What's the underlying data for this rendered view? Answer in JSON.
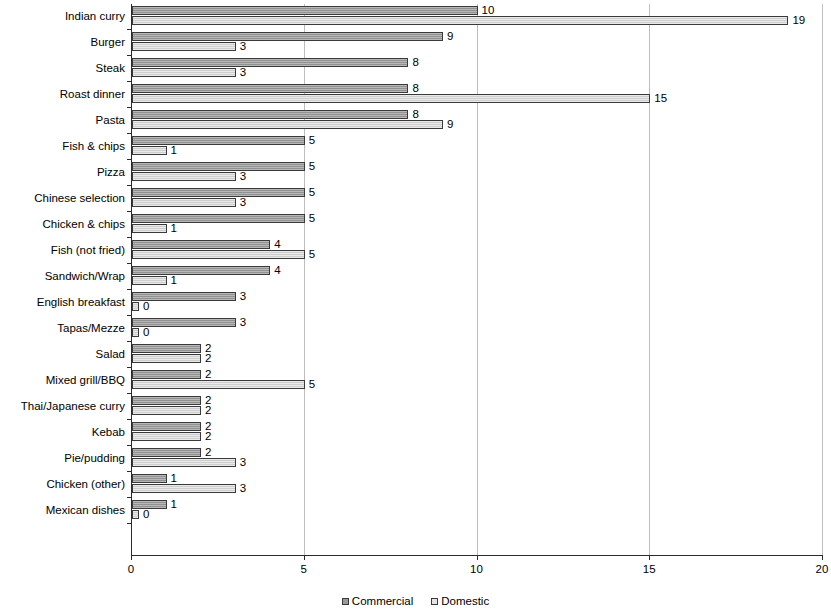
{
  "chart_data": {
    "type": "bar",
    "orientation": "horizontal",
    "title": "",
    "subtitle": "",
    "xlabel": "",
    "ylabel": "",
    "xlim": [
      0,
      20
    ],
    "xticks": [
      0,
      5,
      10,
      15,
      20
    ],
    "xtick_labels": [
      "0",
      "5",
      "10",
      "15",
      "20"
    ],
    "grid": true,
    "grid_axis": "x",
    "legend_position": "bottom",
    "categories": [
      "Indian curry",
      "Burger",
      "Steak",
      "Roast dinner",
      "Pasta",
      "Fish & chips",
      "Pizza",
      "Chinese selection",
      "Chicken & chips",
      "Fish (not fried)",
      "Sandwich/Wrap",
      "English breakfast",
      "Tapas/Mezze",
      "Salad",
      "Mixed grill/BBQ",
      "Thai/Japanese curry",
      "Kebab",
      "Pie/pudding",
      "Chicken (other)",
      "Mexican dishes"
    ],
    "series": [
      {
        "name": "Commercial",
        "color": "#9a9a9a",
        "values": [
          10,
          9,
          8,
          8,
          8,
          5,
          5,
          5,
          5,
          4,
          4,
          3,
          3,
          2,
          2,
          2,
          2,
          2,
          1,
          1
        ],
        "labels": [
          "10",
          "9",
          "8",
          "8",
          "8",
          "5",
          "5",
          "5",
          "5",
          "4",
          "4",
          "3",
          "3",
          "2",
          "2",
          "2",
          "2",
          "2",
          "1",
          "1"
        ]
      },
      {
        "name": "Domestic",
        "color": "#d9d9d9",
        "values": [
          19,
          3,
          3,
          15,
          9,
          1,
          3,
          3,
          1,
          5,
          1,
          0,
          0,
          2,
          5,
          2,
          2,
          3,
          3,
          0
        ],
        "labels": [
          "19",
          "3",
          "3",
          "15",
          "9",
          "1",
          "3",
          "3",
          "1",
          "5",
          "1",
          "0",
          "0",
          "2",
          "5",
          "2",
          "2",
          "3",
          "3",
          "0"
        ]
      }
    ]
  },
  "legend": {
    "items": [
      {
        "label": "Commercial"
      },
      {
        "label": "Domestic"
      }
    ]
  }
}
